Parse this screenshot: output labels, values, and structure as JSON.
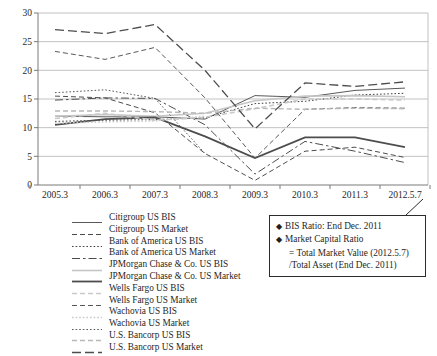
{
  "figure_title": "Bank capital ratios: BIS ratio vs market capital ratio",
  "chart_data": {
    "type": "line",
    "title": "",
    "xlabel": "",
    "ylabel": "",
    "x_categories": [
      "2005.3",
      "2006.3",
      "2007.3",
      "2008.3",
      "2009.3",
      "2010.3",
      "2011.3",
      "2012.5.7"
    ],
    "ylim": [
      0,
      30
    ],
    "ytick_step": 5,
    "ytick_labels": [
      "0",
      "5",
      "10",
      "15",
      "20",
      "25",
      "30"
    ],
    "grid": "horizontal",
    "legend_position": "bottom-left",
    "colors": {
      "dark_line": "#4d4d4d",
      "light_line": "#c6c6c6",
      "gridline": "#b3b3b3",
      "axis": "#7a7a7a",
      "text": "#1f1f1f"
    },
    "series": [
      {
        "name": "Citigroup US BIS",
        "style": "solid",
        "color": "#595959",
        "width": 1,
        "values": [
          12.0,
          11.9,
          11.9,
          11.5,
          15.6,
          15.3,
          16.5,
          16.9
        ]
      },
      {
        "name": "Citigroup US Market",
        "style": "dash",
        "color": "#4d4d4d",
        "width": 1,
        "values": [
          15.5,
          15.2,
          12.6,
          5.5,
          0.8,
          5.9,
          6.6,
          4.8
        ]
      },
      {
        "name": "Bank of America US BIS",
        "style": "dot",
        "color": "#404040",
        "width": 1,
        "values": [
          11.1,
          11.3,
          11.4,
          11.7,
          14.2,
          14.6,
          15.7,
          16.0
        ]
      },
      {
        "name": "Bank of America US Market",
        "style": "dashdot",
        "color": "#4d4d4d",
        "width": 1,
        "values": [
          14.8,
          15.2,
          15.1,
          10.5,
          1.9,
          7.6,
          5.9,
          3.9
        ]
      },
      {
        "name": "JPMorgan Chase & Co. US BIS",
        "style": "solid",
        "color": "#c6c6c6",
        "width": 1.6,
        "values": [
          12.0,
          12.3,
          12.0,
          12.5,
          14.7,
          15.5,
          15.6,
          15.4
        ]
      },
      {
        "name": "JPMorgan Chase & Co. US Market",
        "style": "solid",
        "color": "#4d4d4d",
        "width": 1.8,
        "values": [
          10.5,
          11.5,
          11.8,
          8.5,
          4.7,
          8.3,
          8.3,
          6.6
        ]
      },
      {
        "name": "Wells Fargo US BIS",
        "style": "dash",
        "color": "#c9c9c9",
        "width": 1.6,
        "values": [
          11.6,
          12.5,
          11.3,
          11.8,
          13.3,
          15.0,
          15.0,
          14.8
        ]
      },
      {
        "name": "Wells Fargo US Market",
        "style": "dash",
        "color": "#595959",
        "width": 1,
        "values": [
          23.3,
          21.9,
          24.0,
          15.2,
          4.7,
          13.2,
          13.5,
          13.4
        ]
      },
      {
        "name": "Wachovia US BIS",
        "style": "dot",
        "color": "#c9c9c9",
        "width": 1.6,
        "values": [
          10.8,
          11.0,
          11.2,
          12.0,
          null,
          null,
          null,
          null
        ]
      },
      {
        "name": "Wachovia US Market",
        "style": "dot",
        "color": "#595959",
        "width": 1,
        "values": [
          16.1,
          16.6,
          15.1,
          5.5,
          null,
          null,
          null,
          null
        ]
      },
      {
        "name": "U.S. Bancorp US BIS",
        "style": "dash",
        "color": "#b8b8b8",
        "width": 1.4,
        "values": [
          12.9,
          12.9,
          12.8,
          12.5,
          13.4,
          13.2,
          13.4,
          13.3
        ]
      },
      {
        "name": "U.S. Bancorp US Market",
        "style": "longdash",
        "color": "#4d4d4d",
        "width": 1.3,
        "values": [
          27.1,
          26.4,
          28.0,
          20.0,
          9.8,
          17.8,
          17.2,
          18.0
        ]
      }
    ],
    "annotation": {
      "bullet": "◆",
      "lines": [
        "BIS Ratio: End Dec. 2011",
        "Market Capital Ratio",
        "= Total Market Value (2012.5.7)",
        "/Total Asset (End Dec. 2011)"
      ]
    }
  }
}
